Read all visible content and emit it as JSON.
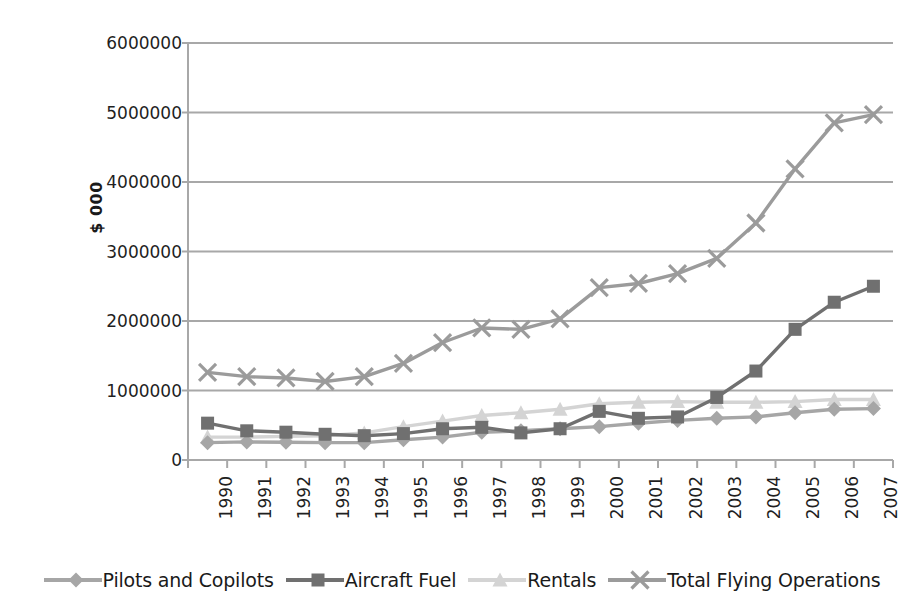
{
  "chart_data": {
    "type": "line",
    "title": "",
    "xlabel": "",
    "ylabel": "$ 000",
    "categories": [
      "1990",
      "1991",
      "1992",
      "1993",
      "1994",
      "1995",
      "1996",
      "1997",
      "1998",
      "1999",
      "2000",
      "2001",
      "2002",
      "2003",
      "2004",
      "2005",
      "2006",
      "2007"
    ],
    "ylim": [
      0,
      6000000
    ],
    "ytick_values": [
      0,
      1000000,
      2000000,
      3000000,
      4000000,
      5000000,
      6000000
    ],
    "ytick_labels": [
      "0",
      "1000000",
      "2000000",
      "3000000",
      "4000000",
      "5000000",
      "6000000"
    ],
    "grid": true,
    "legend_position": "bottom",
    "series": [
      {
        "name": "Pilots and Copilots",
        "color": "#a6a6a6",
        "marker": "diamond",
        "values": [
          250000,
          260000,
          255000,
          250000,
          250000,
          290000,
          330000,
          400000,
          420000,
          450000,
          480000,
          530000,
          570000,
          600000,
          620000,
          680000,
          730000,
          740000
        ]
      },
      {
        "name": "Aircraft Fuel",
        "color": "#707070",
        "marker": "square",
        "values": [
          530000,
          420000,
          400000,
          370000,
          350000,
          380000,
          450000,
          470000,
          390000,
          450000,
          700000,
          600000,
          620000,
          900000,
          1280000,
          1880000,
          2270000,
          2500000
        ]
      },
      {
        "name": "Rentals",
        "color": "#d4d4d4",
        "marker": "triangle",
        "values": [
          330000,
          330000,
          340000,
          350000,
          390000,
          480000,
          560000,
          640000,
          680000,
          730000,
          810000,
          830000,
          840000,
          830000,
          830000,
          840000,
          870000,
          870000
        ]
      },
      {
        "name": "Total Flying Operations",
        "color": "#9b9b9b",
        "marker": "cross",
        "values": [
          1260000,
          1200000,
          1180000,
          1130000,
          1200000,
          1390000,
          1690000,
          1900000,
          1880000,
          2030000,
          2480000,
          2540000,
          2680000,
          2900000,
          3410000,
          4190000,
          4850000,
          4970000
        ]
      }
    ]
  },
  "plot": {
    "left": 188,
    "right": 893,
    "top": 43,
    "bottom": 460,
    "axis_color": "#a8a8a8",
    "grid_color": "#a8a8a8"
  },
  "legend": {
    "items": [
      {
        "label": "Pilots and Copilots",
        "color": "#a6a6a6",
        "marker": "diamond"
      },
      {
        "label": "Aircraft Fuel",
        "color": "#707070",
        "marker": "square"
      },
      {
        "label": "Rentals",
        "color": "#d4d4d4",
        "marker": "triangle"
      },
      {
        "label": "Total Flying Operations",
        "color": "#9b9b9b",
        "marker": "cross"
      }
    ]
  }
}
